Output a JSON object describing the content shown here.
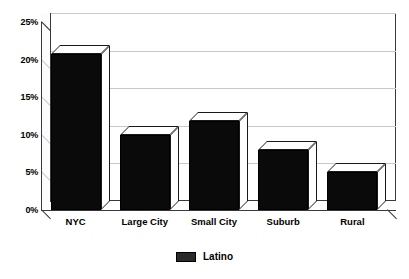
{
  "chart_data": {
    "type": "bar",
    "title": "",
    "xlabel": "",
    "ylabel": "",
    "categories": [
      "NYC",
      "Large City",
      "Small City",
      "Suburb",
      "Rural"
    ],
    "series": [
      {
        "name": "Latino",
        "values": [
          20.7,
          10.0,
          11.8,
          8.0,
          5.0
        ]
      }
    ],
    "values": [
      20.7,
      10.0,
      11.8,
      8.0,
      5.0
    ],
    "ylim": [
      0,
      25
    ],
    "ytick_values": [
      0,
      5,
      10,
      15,
      20,
      25
    ],
    "ytick_labels": [
      "0%",
      "5%",
      "10%",
      "15%",
      "20%",
      "25%"
    ],
    "grid": true,
    "legend_position": "bottom-center",
    "style_3d": true,
    "colors": {
      "bar_fill": "#0a0a0a",
      "bar_top": "#ffffff",
      "bar_side": "#ffffff",
      "gridline": "#c9c9c9",
      "axis": "#3a3a3a",
      "background": "#ffffff",
      "legend_swatch": "#2a2a2a"
    }
  },
  "legend": {
    "items": [
      {
        "label": "Latino",
        "color": "#2a2a2a"
      }
    ]
  }
}
